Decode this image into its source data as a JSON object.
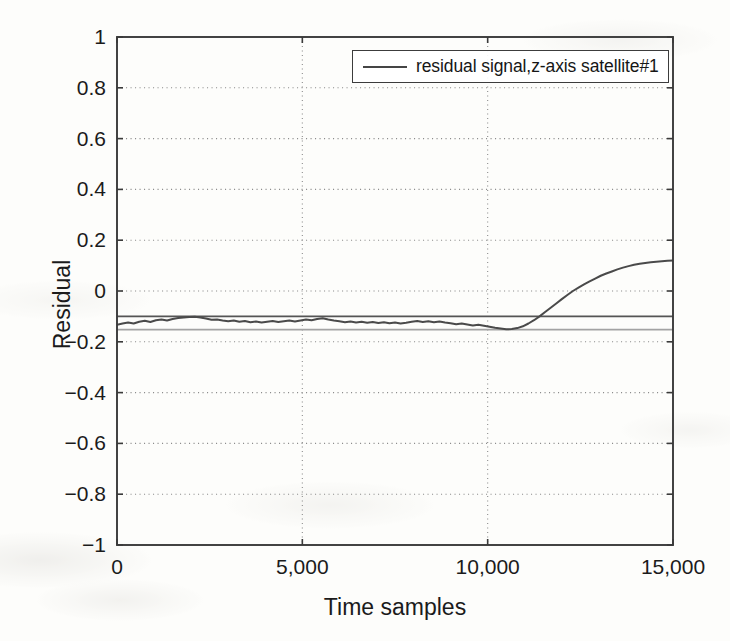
{
  "chart_data": {
    "type": "line",
    "title": "",
    "xlabel": "Time samples",
    "ylabel": "Residual",
    "xlim": [
      0,
      15000
    ],
    "ylim": [
      -1,
      1
    ],
    "grid": true,
    "legend_position": "top-right",
    "xticks": [
      0,
      5000,
      10000,
      15000
    ],
    "xticklabels": [
      "0",
      "5,000",
      "10,000",
      "15,000"
    ],
    "yticks": [
      -1,
      -0.8,
      -0.6,
      -0.4,
      -0.2,
      0,
      0.2,
      0.4,
      0.6,
      0.8,
      1
    ],
    "yticklabels": [
      "−1",
      "−0.8",
      "−0.6",
      "−0.4",
      "−0.2",
      "0",
      "0.2",
      "0.4",
      "0.6",
      "0.8",
      "1"
    ],
    "series": [
      {
        "name": "residual signal,z-axis satellite#1",
        "color": "#4a4a4a",
        "linewidth": 2.0,
        "x": [
          0,
          150,
          300,
          450,
          600,
          750,
          900,
          1050,
          1200,
          1350,
          1500,
          1650,
          1800,
          1950,
          2100,
          2250,
          2400,
          2550,
          2700,
          2850,
          3000,
          3150,
          3300,
          3450,
          3600,
          3750,
          3900,
          4050,
          4200,
          4350,
          4500,
          4650,
          4800,
          4950,
          5100,
          5250,
          5400,
          5550,
          5700,
          5850,
          6000,
          6150,
          6300,
          6450,
          6600,
          6750,
          6900,
          7050,
          7200,
          7350,
          7500,
          7650,
          7800,
          7950,
          8100,
          8250,
          8400,
          8550,
          8700,
          8850,
          9000,
          9150,
          9300,
          9450,
          9600,
          9750,
          9900,
          10050,
          10200,
          10350,
          10500,
          10650,
          10800,
          10950,
          11100,
          11250,
          11400,
          11550,
          11700,
          11850,
          12000,
          12150,
          12300,
          12450,
          12600,
          12750,
          12900,
          13050,
          13200,
          13350,
          13500,
          13650,
          13800,
          13950,
          14100,
          14250,
          14400,
          14550,
          14700,
          14850,
          15000
        ],
        "y": [
          -0.133,
          -0.128,
          -0.124,
          -0.128,
          -0.121,
          -0.117,
          -0.122,
          -0.115,
          -0.112,
          -0.116,
          -0.11,
          -0.106,
          -0.104,
          -0.102,
          -0.101,
          -0.104,
          -0.108,
          -0.113,
          -0.112,
          -0.116,
          -0.119,
          -0.116,
          -0.121,
          -0.118,
          -0.123,
          -0.12,
          -0.124,
          -0.121,
          -0.118,
          -0.122,
          -0.119,
          -0.116,
          -0.12,
          -0.116,
          -0.112,
          -0.115,
          -0.11,
          -0.107,
          -0.112,
          -0.116,
          -0.119,
          -0.123,
          -0.12,
          -0.124,
          -0.121,
          -0.125,
          -0.122,
          -0.126,
          -0.123,
          -0.127,
          -0.124,
          -0.128,
          -0.125,
          -0.121,
          -0.118,
          -0.122,
          -0.119,
          -0.123,
          -0.12,
          -0.124,
          -0.127,
          -0.131,
          -0.128,
          -0.132,
          -0.136,
          -0.133,
          -0.137,
          -0.141,
          -0.145,
          -0.148,
          -0.151,
          -0.15,
          -0.146,
          -0.139,
          -0.128,
          -0.115,
          -0.1,
          -0.083,
          -0.066,
          -0.049,
          -0.032,
          -0.016,
          0.0,
          0.013,
          0.026,
          0.038,
          0.049,
          0.06,
          0.069,
          0.077,
          0.085,
          0.092,
          0.098,
          0.103,
          0.107,
          0.11,
          0.113,
          0.115,
          0.117,
          0.119,
          0.12
        ]
      }
    ],
    "threshold_lines": [
      {
        "name": "upper-threshold",
        "value": -0.1,
        "color": "#555555",
        "linewidth": 1.8
      },
      {
        "name": "lower-threshold",
        "value": -0.152,
        "color": "#a3a3a3",
        "linewidth": 1.6
      }
    ]
  },
  "legend": {
    "entries": [
      {
        "label": "residual signal,z-axis satellite#1"
      }
    ]
  },
  "axes": {
    "xlabel": "Time samples",
    "ylabel": "Residual"
  }
}
